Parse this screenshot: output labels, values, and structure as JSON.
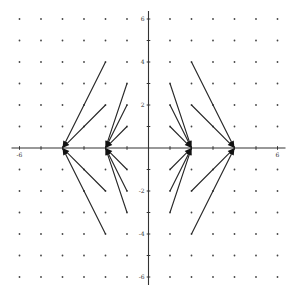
{
  "chart_data": {
    "type": "vector_field",
    "title": "",
    "xlabel": "",
    "ylabel": "",
    "xlim": [
      -6,
      6
    ],
    "ylim": [
      -6,
      6
    ],
    "grid": "dots",
    "grid_step": 1,
    "x_tick_labels": [
      {
        "value": -6,
        "label": "-6"
      },
      {
        "value": 6,
        "label": "6"
      }
    ],
    "y_tick_labels": [
      {
        "value": 6,
        "label": "6"
      },
      {
        "value": 4,
        "label": "4"
      },
      {
        "value": 2,
        "label": "2"
      },
      {
        "value": -2,
        "label": "-2"
      },
      {
        "value": -4,
        "label": "-4"
      },
      {
        "value": -6,
        "label": "-6"
      }
    ],
    "vectors": [
      {
        "from": [
          -2,
          4
        ],
        "to": [
          -4,
          0
        ]
      },
      {
        "from": [
          -2,
          2
        ],
        "to": [
          -4,
          0
        ]
      },
      {
        "from": [
          -2,
          -2
        ],
        "to": [
          -4,
          0
        ]
      },
      {
        "from": [
          -2,
          -4
        ],
        "to": [
          -4,
          0
        ]
      },
      {
        "from": [
          -1,
          3
        ],
        "to": [
          -2,
          0
        ]
      },
      {
        "from": [
          -1,
          2
        ],
        "to": [
          -2,
          0
        ]
      },
      {
        "from": [
          -1,
          1
        ],
        "to": [
          -2,
          0
        ]
      },
      {
        "from": [
          -1,
          -1
        ],
        "to": [
          -2,
          0
        ]
      },
      {
        "from": [
          -1,
          -2
        ],
        "to": [
          -2,
          0
        ]
      },
      {
        "from": [
          -1,
          -3
        ],
        "to": [
          -2,
          0
        ]
      },
      {
        "from": [
          1,
          3
        ],
        "to": [
          2,
          0
        ]
      },
      {
        "from": [
          1,
          2
        ],
        "to": [
          2,
          0
        ]
      },
      {
        "from": [
          1,
          1
        ],
        "to": [
          2,
          0
        ]
      },
      {
        "from": [
          1,
          -1
        ],
        "to": [
          2,
          0
        ]
      },
      {
        "from": [
          1,
          -2
        ],
        "to": [
          2,
          0
        ]
      },
      {
        "from": [
          1,
          -3
        ],
        "to": [
          2,
          0
        ]
      },
      {
        "from": [
          2,
          4
        ],
        "to": [
          4,
          0
        ]
      },
      {
        "from": [
          2,
          2
        ],
        "to": [
          4,
          0
        ]
      },
      {
        "from": [
          2,
          -2
        ],
        "to": [
          4,
          0
        ]
      },
      {
        "from": [
          2,
          -4
        ],
        "to": [
          4,
          0
        ]
      }
    ]
  },
  "layout": {
    "origin_px": [
      148.5,
      148
    ],
    "unit_px": 21.5
  }
}
